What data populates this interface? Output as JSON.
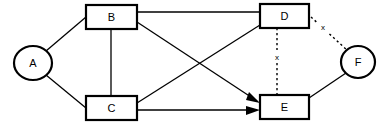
{
  "diagram": {
    "canvas": {
      "width": 388,
      "height": 132,
      "background": "#ffffff"
    },
    "stroke_color": "#000000",
    "nodes": [
      {
        "id": "A",
        "label": "A",
        "shape": "ellipse",
        "cx": 33,
        "cy": 63,
        "rx": 19,
        "ry": 17
      },
      {
        "id": "B",
        "label": "B",
        "shape": "rect",
        "x": 86,
        "y": 5,
        "w": 51,
        "h": 24
      },
      {
        "id": "C",
        "label": "C",
        "shape": "rect",
        "x": 86,
        "y": 96,
        "w": 51,
        "h": 24
      },
      {
        "id": "D",
        "label": "D",
        "shape": "rect",
        "x": 260,
        "y": 4,
        "w": 49,
        "h": 24
      },
      {
        "id": "E",
        "label": "E",
        "shape": "rect",
        "x": 260,
        "y": 95,
        "w": 49,
        "h": 24
      },
      {
        "id": "F",
        "label": "F",
        "shape": "ellipse",
        "cx": 358,
        "cy": 62,
        "rx": 17,
        "ry": 16
      }
    ],
    "edges": [
      {
        "id": "A-B",
        "from": "A",
        "to": "B",
        "style": "solid",
        "arrow": false,
        "label": ""
      },
      {
        "id": "A-C",
        "from": "A",
        "to": "C",
        "style": "solid",
        "arrow": false,
        "label": ""
      },
      {
        "id": "B-C",
        "from": "B",
        "to": "C",
        "style": "solid",
        "arrow": false,
        "label": ""
      },
      {
        "id": "B-D",
        "from": "B",
        "to": "D",
        "style": "solid",
        "arrow": false,
        "label": ""
      },
      {
        "id": "B-E",
        "from": "B",
        "to": "E",
        "style": "solid",
        "arrow": true,
        "label": ""
      },
      {
        "id": "C-D",
        "from": "C",
        "to": "D",
        "style": "solid",
        "arrow": false,
        "label": ""
      },
      {
        "id": "C-E",
        "from": "C",
        "to": "E",
        "style": "solid",
        "arrow": true,
        "label": ""
      },
      {
        "id": "D-E",
        "from": "D",
        "to": "E",
        "style": "dashed",
        "arrow": false,
        "label": "x"
      },
      {
        "id": "D-F",
        "from": "D",
        "to": "F",
        "style": "dashed",
        "arrow": false,
        "label": "x"
      },
      {
        "id": "E-F",
        "from": "E",
        "to": "F",
        "style": "solid",
        "arrow": false,
        "label": ""
      }
    ],
    "edge_labels": {
      "de_label": "x",
      "df_label": "x"
    }
  }
}
